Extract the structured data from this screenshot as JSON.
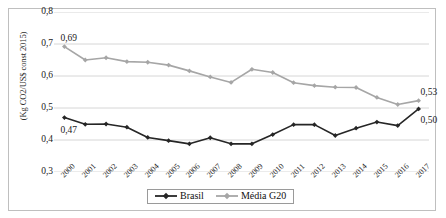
{
  "top_caption_fragment": "",
  "chart_data": {
    "type": "line",
    "title": "",
    "xlabel": "",
    "ylabel": "(Kg CO2/US$ const 2015)",
    "ylim": [
      0.3,
      0.8
    ],
    "ytick_values": [
      0.8,
      0.7,
      0.6,
      0.5,
      0.4,
      0.3
    ],
    "ytick_labels": [
      "0,8",
      "0,7",
      "0,6",
      "0,5",
      "0,4",
      "0,3"
    ],
    "grid": "horizontal",
    "legend_position": "bottom",
    "categories": [
      "2000",
      "2001",
      "2002",
      "2003",
      "2004",
      "2005",
      "2006",
      "2007",
      "2008",
      "2009",
      "2010",
      "2011",
      "2012",
      "2013",
      "2014",
      "2015",
      "2016",
      "2017"
    ],
    "series": [
      {
        "name": "Brasil",
        "color": "#262626",
        "marker": "diamond",
        "values": [
          0.47,
          0.449,
          0.45,
          0.44,
          0.408,
          0.398,
          0.388,
          0.407,
          0.388,
          0.388,
          0.417,
          0.448,
          0.448,
          0.414,
          0.437,
          0.456,
          0.445,
          0.497
        ]
      },
      {
        "name": "Média G20",
        "color": "#a6a6a6",
        "marker": "diamond",
        "values": [
          0.692,
          0.65,
          0.657,
          0.645,
          0.643,
          0.634,
          0.616,
          0.597,
          0.58,
          0.621,
          0.611,
          0.579,
          0.57,
          0.565,
          0.564,
          0.533,
          0.511,
          0.523
        ]
      }
    ],
    "data_labels": [
      {
        "text": "0,69",
        "series": "Média G20",
        "category": "2000",
        "value": 0.69
      },
      {
        "text": "0,47",
        "series": "Brasil",
        "category": "2000",
        "value": 0.47
      },
      {
        "text": "0,53",
        "series": "Média G20",
        "category": "2017",
        "value": 0.53
      },
      {
        "text": "0,50",
        "series": "Brasil",
        "category": "2017",
        "value": 0.5
      }
    ]
  },
  "legend": {
    "items": [
      {
        "label": "Brasil",
        "color": "#262626"
      },
      {
        "label": "Média G20",
        "color": "#a6a6a6"
      }
    ]
  }
}
